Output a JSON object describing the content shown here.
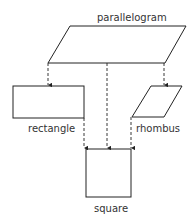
{
  "diagram": {
    "type": "hierarchy",
    "nodes": {
      "parallelogram": {
        "label": "parallelogram"
      },
      "rectangle": {
        "label": "rectangle"
      },
      "rhombus": {
        "label": "rhombus"
      },
      "square": {
        "label": "square"
      }
    },
    "edges": [
      {
        "from": "parallelogram",
        "to": "rectangle"
      },
      {
        "from": "parallelogram",
        "to": "rhombus"
      },
      {
        "from": "parallelogram",
        "to": "square"
      },
      {
        "from": "rectangle",
        "to": "square"
      },
      {
        "from": "rhombus",
        "to": "square"
      }
    ],
    "colors": {
      "stroke": "#222222",
      "text": "#333333",
      "background": "#ffffff"
    }
  }
}
